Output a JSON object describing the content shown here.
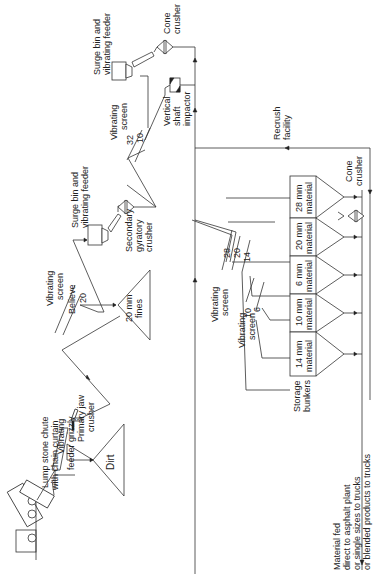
{
  "diagram": {
    "orientation": "rotated 90deg counter-clockwise",
    "labels": {
      "lump_chute": [
        "Lump stone chute",
        "with chain curtain"
      ],
      "feeder_grizzly": [
        "Vibrating",
        "feeder grizzly"
      ],
      "primary_jaw": [
        "Primary jaw",
        "crusher"
      ],
      "dirt": "Dirt",
      "screen1": [
        "Vibrating",
        "screen"
      ],
      "screen1_decks": [
        "Believe",
        "20"
      ],
      "fines": [
        "20 mm",
        "fines"
      ],
      "surge1": [
        "Surge bin and",
        "vibrating feeder"
      ],
      "secondary_gyratory": [
        "Secondary",
        "gyratory",
        "crusher"
      ],
      "screen2": [
        "Vibrating",
        "screen"
      ],
      "screen2_decks": [
        "32",
        "10"
      ],
      "vsi": [
        "Vertical",
        "shaft",
        "impactor"
      ],
      "surge2": [
        "Surge bin and",
        "vibrating feeder"
      ],
      "cone1": [
        "Cone",
        "crusher"
      ],
      "recrush": [
        "Recrush",
        "facility"
      ],
      "screen3": [
        "Vibrating",
        "screen"
      ],
      "screen3_decks": [
        "28",
        "20",
        "14"
      ],
      "screen4": [
        "Vibrating",
        "screen"
      ],
      "screen4_decks": [
        "10",
        "6"
      ],
      "storage": [
        "Storage",
        "bunkers"
      ],
      "cone2": [
        "Cone",
        "crusher"
      ],
      "output": [
        "Material fed",
        "direct to asphalt plant",
        "or single sizes to trucks",
        "or blended products to trucks"
      ]
    },
    "bunkers": [
      [
        "14 mm",
        "material"
      ],
      [
        "10 mm",
        "material"
      ],
      [
        "6 mm",
        "material"
      ],
      [
        "20 mm",
        "material"
      ],
      [
        "28 mm",
        "material"
      ]
    ]
  }
}
